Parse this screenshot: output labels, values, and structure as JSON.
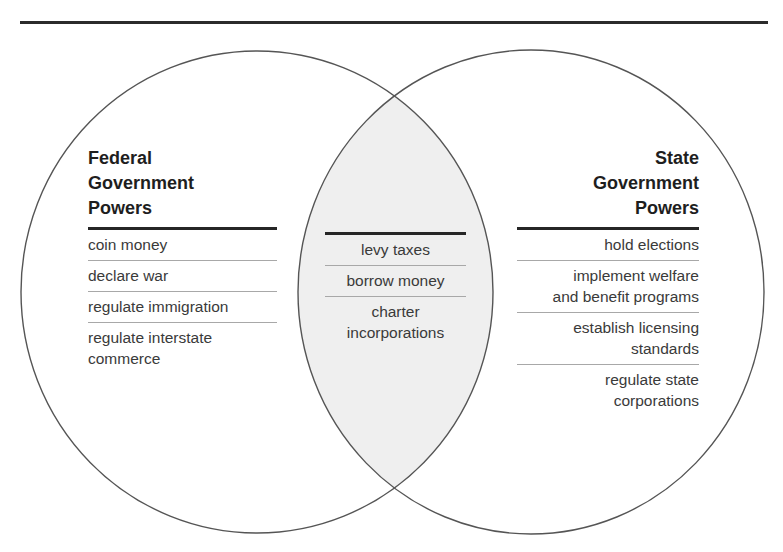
{
  "diagram": {
    "type": "venn",
    "colors": {
      "outline": "#555555",
      "intersection_fill": "#efefef",
      "rule": "#262626",
      "divider": "#a8a8a8"
    },
    "left": {
      "heading_lines": [
        "Federal",
        "Government",
        "Powers"
      ],
      "items": [
        {
          "lines": [
            "coin money"
          ]
        },
        {
          "lines": [
            "declare war"
          ]
        },
        {
          "lines": [
            "regulate immigration"
          ]
        },
        {
          "lines": [
            "regulate interstate",
            "commerce"
          ]
        }
      ]
    },
    "shared": {
      "items": [
        {
          "lines": [
            "levy taxes"
          ]
        },
        {
          "lines": [
            "borrow money"
          ]
        },
        {
          "lines": [
            "charter",
            "incorporations"
          ]
        }
      ]
    },
    "right": {
      "heading_lines": [
        "State",
        "Government",
        "Powers"
      ],
      "items": [
        {
          "lines": [
            "hold elections"
          ]
        },
        {
          "lines": [
            "implement welfare",
            "and benefit programs"
          ]
        },
        {
          "lines": [
            "establish licensing",
            "standards"
          ]
        },
        {
          "lines": [
            "regulate state",
            "corporations"
          ]
        }
      ]
    }
  }
}
